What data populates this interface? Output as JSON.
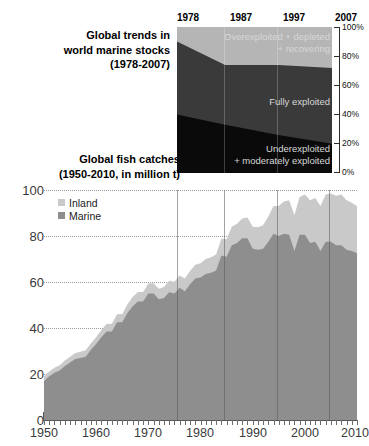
{
  "colors": {
    "inland": "#c9c9c9",
    "marine": "#8e8e8e",
    "overexploited": "#b5b5b5",
    "fully_exploited": "#3a3a3a",
    "underexploited": "#0a0a0a",
    "grid": "#9a9a9a",
    "text": "#000000"
  },
  "top_panel": {
    "title_line1": "Global trends in",
    "title_line2": "world marine stocks",
    "title_line3": "(1978-2007)",
    "x_labels": [
      "1978",
      "1987",
      "1997",
      "2007"
    ],
    "y_labels": [
      "100%",
      "80%",
      "60%",
      "40%",
      "20%",
      "0%"
    ],
    "band_labels": {
      "over_line1": "Overexploited + depleted",
      "over_line2": "+ recovering",
      "fully": "Fully exploited",
      "under_line1": "Underexploited",
      "under_line2": "+ moderately exploited"
    }
  },
  "bottom_panel": {
    "title_line1": "Global fish catches",
    "title_line2": "(1950-2010, in million t)",
    "y_labels": [
      "100",
      "80",
      "60",
      "40",
      "20",
      "0"
    ],
    "x_labels": [
      "1950",
      "1960",
      "1970",
      "1980",
      "1990",
      "2000",
      "2010"
    ],
    "legend": [
      {
        "label": "Inland",
        "color": "#c9c9c9"
      },
      {
        "label": "Marine",
        "color": "#8e8e8e"
      }
    ]
  },
  "chart_data": [
    {
      "type": "area",
      "id": "world-marine-stocks",
      "title": "Global trends in world marine stocks (1978-2007)",
      "xlabel": "",
      "ylabel": "Percent of stocks",
      "stacked": true,
      "normalized_percent": true,
      "xlim": [
        1978,
        2007
      ],
      "ylim": [
        0,
        100
      ],
      "grid": false,
      "legend_position": "in-plot",
      "x": [
        1978,
        1987,
        1997,
        2007
      ],
      "series": [
        {
          "name": "Underexploited + moderately exploited",
          "color": "#0a0a0a",
          "values": [
            40,
            33,
            26,
            20
          ]
        },
        {
          "name": "Fully exploited",
          "color": "#3a3a3a",
          "values": [
            50,
            41,
            48,
            52
          ]
        },
        {
          "name": "Overexploited + depleted + recovering",
          "color": "#b5b5b5",
          "values": [
            10,
            26,
            26,
            28
          ]
        }
      ],
      "cumulative_tops": {
        "underexploited": [
          40,
          33,
          26,
          20
        ],
        "fully_exploited": [
          90,
          74,
          74,
          72
        ]
      }
    },
    {
      "type": "area",
      "id": "global-fish-catches",
      "title": "Global fish catches (1950-2010, in million t)",
      "xlabel": "",
      "ylabel": "million t",
      "stacked": true,
      "grid": true,
      "xlim": [
        1950,
        2010
      ],
      "ylim": [
        0,
        100
      ],
      "yticks": [
        0,
        20,
        40,
        60,
        80,
        100
      ],
      "xticks": [
        1950,
        1960,
        1970,
        1980,
        1990,
        2000,
        2010
      ],
      "legend_position": "top-left",
      "x": [
        1950,
        1951,
        1952,
        1953,
        1954,
        1955,
        1956,
        1957,
        1958,
        1959,
        1960,
        1961,
        1962,
        1963,
        1964,
        1965,
        1966,
        1967,
        1968,
        1969,
        1970,
        1971,
        1972,
        1973,
        1974,
        1975,
        1976,
        1977,
        1978,
        1979,
        1980,
        1981,
        1982,
        1983,
        1984,
        1985,
        1986,
        1987,
        1988,
        1989,
        1990,
        1991,
        1992,
        1993,
        1994,
        1995,
        1996,
        1997,
        1998,
        1999,
        2000,
        2001,
        2002,
        2003,
        2004,
        2005,
        2006,
        2007,
        2008,
        2009,
        2010
      ],
      "series": [
        {
          "name": "Marine",
          "color": "#8e8e8e",
          "values": [
            17.0,
            19.0,
            20.5,
            21.5,
            23.5,
            25.0,
            26.5,
            27.0,
            27.5,
            30.5,
            33.0,
            36.0,
            38.5,
            38.5,
            42.5,
            42.5,
            46.5,
            49.5,
            51.5,
            51.5,
            55.0,
            55.0,
            52.5,
            53.0,
            55.5,
            55.0,
            57.5,
            56.0,
            59.0,
            61.5,
            62.0,
            63.5,
            64.0,
            65.0,
            71.5,
            71.0,
            76.0,
            77.0,
            79.0,
            79.0,
            74.5,
            74.0,
            74.5,
            77.5,
            81.0,
            80.0,
            81.0,
            80.5,
            73.5,
            80.5,
            80.5,
            77.0,
            77.5,
            73.5,
            77.5,
            77.5,
            76.0,
            76.0,
            74.0,
            73.5,
            72.5
          ]
        },
        {
          "name": "Inland",
          "color": "#c9c9c9",
          "values": [
            2.0,
            2.1,
            2.2,
            2.3,
            2.4,
            2.5,
            2.6,
            2.7,
            2.8,
            2.9,
            3.0,
            3.1,
            3.2,
            3.4,
            3.5,
            3.6,
            3.8,
            4.0,
            4.1,
            4.2,
            4.4,
            4.5,
            4.6,
            4.8,
            5.0,
            5.1,
            5.3,
            5.5,
            5.8,
            6.0,
            6.2,
            6.5,
            6.8,
            7.0,
            7.3,
            7.6,
            8.0,
            8.3,
            8.6,
            9.0,
            9.5,
            9.8,
            10.2,
            11.0,
            12.0,
            13.0,
            14.0,
            15.0,
            15.5,
            16.5,
            17.5,
            18.5,
            19.0,
            19.5,
            20.5,
            21.0,
            21.5,
            22.0,
            21.5,
            21.0,
            20.5
          ]
        }
      ]
    }
  ]
}
